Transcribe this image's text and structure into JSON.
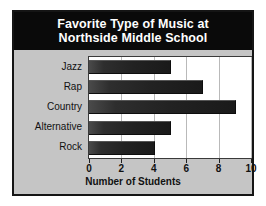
{
  "figure": {
    "title_lines": [
      "Favorite Type of Music at",
      "Northside Middle School"
    ],
    "title_background": "#0a0a0a",
    "title_color": "#ffffff",
    "panel_background": "#c5c5c5",
    "plot_background": "#ffffff",
    "bar_color": "#222222",
    "gridline_color": "#b9b9b9"
  },
  "chart_data": {
    "type": "bar",
    "orientation": "horizontal",
    "title": "Favorite Type of Music at Northside Middle School",
    "categories": [
      "Jazz",
      "Rap",
      "Country",
      "Alternative",
      "Rock"
    ],
    "values": [
      5,
      7,
      9,
      5,
      4
    ],
    "xlabel": "Number of Students",
    "ylabel": "",
    "xlim": [
      0,
      10
    ],
    "xticks": [
      0,
      2,
      4,
      6,
      8,
      10
    ],
    "xtick_labels": [
      "0",
      "2",
      "4",
      "6",
      "8",
      "10"
    ],
    "grid": true,
    "grid_axis": "x",
    "legend": false
  }
}
